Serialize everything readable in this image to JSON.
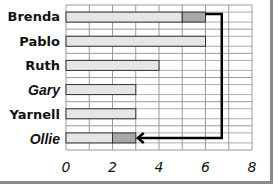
{
  "chart_data": {
    "type": "bar",
    "orientation": "horizontal",
    "title": "",
    "xlabel": "",
    "ylabel": "",
    "xlim": [
      0,
      8
    ],
    "xticks": [
      0,
      2,
      4,
      6,
      8
    ],
    "grid": true,
    "categories": [
      "Brenda",
      "Pablo",
      "Ruth",
      "Gary",
      "Yarnell",
      "Ollie"
    ],
    "values": [
      6,
      6,
      4,
      3,
      3,
      3
    ],
    "segments": [
      {
        "name": "Brenda",
        "light": 5,
        "dark": 1
      },
      {
        "name": "Pablo",
        "light": 6,
        "dark": 0
      },
      {
        "name": "Ruth",
        "light": 4,
        "dark": 0
      },
      {
        "name": "Gary",
        "light": 3,
        "dark": 0
      },
      {
        "name": "Yarnell",
        "light": 3,
        "dark": 0
      },
      {
        "name": "Ollie",
        "light": 2,
        "dark": 1
      }
    ],
    "annotations": [
      {
        "type": "arrow",
        "from": {
          "category": "Brenda",
          "x": 6
        },
        "to": {
          "category": "Ollie",
          "x": 3
        },
        "description": "Arrow moving Brenda's dark segment (5–6) to Ollie (2–3)"
      }
    ],
    "colors": {
      "light": "#e6e6e6",
      "dark": "#a8a8a8",
      "grid": "#9a9a9a",
      "arrow": "#000000"
    }
  },
  "labels": {
    "rows": [
      "Brenda",
      "Pablo",
      "Ruth",
      "Gary",
      "Yarnell",
      "Ollie"
    ],
    "ticks": [
      "0",
      "2",
      "4",
      "6",
      "8"
    ]
  }
}
